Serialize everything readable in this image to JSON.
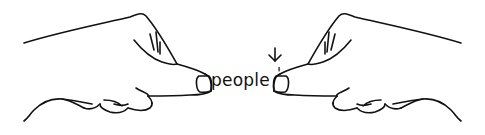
{
  "illustration": {
    "word": "people",
    "apostrophe": "'",
    "arrow_direction": "down",
    "stroke_color": "#111111",
    "background": "#ffffff"
  }
}
